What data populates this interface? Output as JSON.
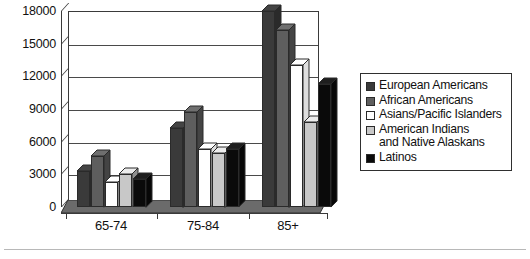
{
  "chart_data": {
    "type": "bar",
    "title": "",
    "subtitle": "",
    "xlabel": "",
    "ylabel": "",
    "categories": [
      "65-74",
      "75-84",
      "85+"
    ],
    "ylim": [
      0,
      18000
    ],
    "yticks": [
      0,
      3000,
      6000,
      9000,
      12000,
      15000,
      18000
    ],
    "ytick_labels": [
      "0",
      "3000",
      "6000",
      "9000",
      "12000",
      "15000",
      "18000"
    ],
    "grid": true,
    "legend_position": "right",
    "style": "3d-grouped-bars-grayscale",
    "series": [
      {
        "name": "European Americans",
        "color": "#3a3a3a",
        "values": [
          3300,
          7300,
          18000
        ]
      },
      {
        "name": "African Americans",
        "color": "#5e5e5e",
        "values": [
          4700,
          8700,
          16300
        ]
      },
      {
        "name": "Asians/Pacific Islanders",
        "color": "#ffffff",
        "values": [
          2300,
          5300,
          13000
        ]
      },
      {
        "name": "American Indians and Native Alaskans",
        "color": "#c8c8c8",
        "values": [
          3000,
          5000,
          7800
        ]
      },
      {
        "name": "Latinos",
        "color": "#0a0a0a",
        "values": [
          2600,
          5300,
          11300
        ]
      }
    ]
  },
  "legend": {
    "items": [
      {
        "label": "European Americans",
        "label_line2": ""
      },
      {
        "label": "African Americans",
        "label_line2": ""
      },
      {
        "label": "Asians/Pacific Islanders",
        "label_line2": ""
      },
      {
        "label": "American Indians",
        "label_line2": "and Native Alaskans"
      },
      {
        "label": "Latinos",
        "label_line2": ""
      }
    ]
  },
  "axis": {
    "y_labels": [
      "18000",
      "15000",
      "12000",
      "9000",
      "6000",
      "3000",
      "0"
    ],
    "x_labels": [
      "65-74",
      "75-84",
      "85+"
    ]
  },
  "colors": {
    "series_1": "#3a3a3a",
    "series_2": "#5e5e5e",
    "series_3": "#ffffff",
    "series_4": "#c8c8c8",
    "series_5": "#0a0a0a",
    "frame": "#3a3a3a",
    "grid": "#4a4a4a",
    "floor": "#6b6b6b",
    "text": "#111111"
  }
}
